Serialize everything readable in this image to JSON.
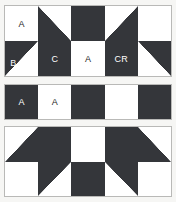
{
  "diagram": {
    "colors": {
      "dark": "#34363a",
      "light": "#ffffff",
      "background": "#f6f6f4",
      "border": "#b9b9b7",
      "label_on_dark": "#ffffff",
      "label_on_light": "#1c1c1c"
    },
    "panels": [
      {
        "name": "top-row-unit",
        "columns": 5,
        "rows": 2,
        "cells": [
          {
            "id": "r0c0",
            "fill": "light",
            "label": "A",
            "label_on": "light",
            "label_pos": "center"
          },
          {
            "id": "r0c1",
            "fill": "tri-bl",
            "label": "",
            "label_on": "dark",
            "label_pos": "center"
          },
          {
            "id": "r0c2",
            "fill": "dark",
            "label": "",
            "label_on": "dark",
            "label_pos": "center"
          },
          {
            "id": "r0c3",
            "fill": "tri-br",
            "label": "",
            "label_on": "dark",
            "label_pos": "center"
          },
          {
            "id": "r0c4",
            "fill": "light",
            "label": "",
            "label_on": "light",
            "label_pos": "center"
          },
          {
            "id": "r1c0",
            "fill": "tri-tl",
            "label": "B",
            "label_on": "dark",
            "label_pos": "left-down"
          },
          {
            "id": "r1c1",
            "fill": "dark",
            "label": "C",
            "label_on": "dark",
            "label_pos": "center"
          },
          {
            "id": "r1c2",
            "fill": "light",
            "label": "A",
            "label_on": "light",
            "label_pos": "center"
          },
          {
            "id": "r1c3",
            "fill": "dark",
            "label": "CR",
            "label_on": "dark",
            "label_pos": "center"
          },
          {
            "id": "r1c4",
            "fill": "tri-tr",
            "label": "",
            "label_on": "dark",
            "label_pos": "center"
          }
        ]
      },
      {
        "name": "middle-row-unit",
        "columns": 5,
        "rows": 1,
        "cells": [
          {
            "id": "m0c0",
            "fill": "dark",
            "label": "A",
            "label_on": "dark",
            "label_pos": "center"
          },
          {
            "id": "m0c1",
            "fill": "light",
            "label": "A",
            "label_on": "light",
            "label_pos": "center"
          },
          {
            "id": "m0c2",
            "fill": "dark",
            "label": "",
            "label_on": "dark",
            "label_pos": "center"
          },
          {
            "id": "m0c3",
            "fill": "light",
            "label": "",
            "label_on": "light",
            "label_pos": "center"
          },
          {
            "id": "m0c4",
            "fill": "dark",
            "label": "",
            "label_on": "dark",
            "label_pos": "center"
          }
        ]
      },
      {
        "name": "bottom-row-unit",
        "columns": 5,
        "rows": 2,
        "cells": [
          {
            "id": "b0c0",
            "fill": "tri-br",
            "label": "",
            "label_on": "dark",
            "label_pos": "center"
          },
          {
            "id": "b0c1",
            "fill": "dark",
            "label": "",
            "label_on": "dark",
            "label_pos": "center"
          },
          {
            "id": "b0c2",
            "fill": "light",
            "label": "",
            "label_on": "light",
            "label_pos": "center"
          },
          {
            "id": "b0c3",
            "fill": "dark",
            "label": "",
            "label_on": "dark",
            "label_pos": "center"
          },
          {
            "id": "b0c4",
            "fill": "tri-bl",
            "label": "",
            "label_on": "dark",
            "label_pos": "center"
          },
          {
            "id": "b1c0",
            "fill": "light",
            "label": "",
            "label_on": "light",
            "label_pos": "center"
          },
          {
            "id": "b1c1",
            "fill": "tri-tl",
            "label": "",
            "label_on": "dark",
            "label_pos": "center"
          },
          {
            "id": "b1c2",
            "fill": "dark",
            "label": "",
            "label_on": "dark",
            "label_pos": "center"
          },
          {
            "id": "b1c3",
            "fill": "tri-tr",
            "label": "",
            "label_on": "dark",
            "label_pos": "center"
          },
          {
            "id": "b1c4",
            "fill": "light",
            "label": "",
            "label_on": "light",
            "label_pos": "center"
          }
        ]
      }
    ]
  }
}
